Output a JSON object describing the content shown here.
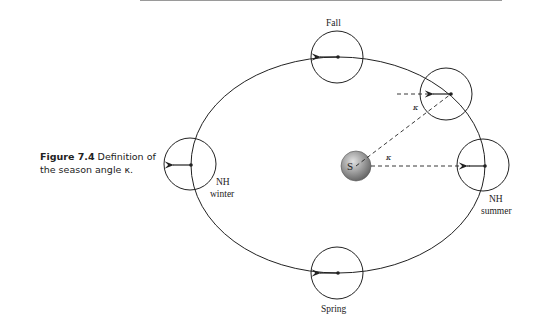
{
  "caption": {
    "figure_label": "Figure 7.4",
    "text": "Definition of the season angle κ."
  },
  "diagram": {
    "sun_label": "S",
    "angle_symbol": "κ",
    "positions": {
      "fall": "Fall",
      "spring": "Spring",
      "winter_line1": "NH",
      "winter_line2": "winter",
      "summer_line1": "NH",
      "summer_line2": "summer"
    },
    "colors": {
      "line": "#222222",
      "sun_light": "#cfcfcf",
      "sun_dark": "#6a6a6a"
    }
  }
}
